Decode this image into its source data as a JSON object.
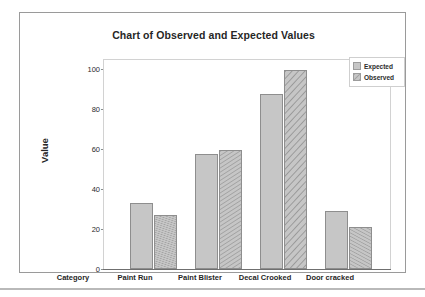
{
  "chart_data": {
    "type": "bar",
    "title": "Chart of Observed and Expected Values",
    "xlabel": "Category",
    "ylabel": "Value",
    "categories": [
      "Paint Run",
      "Paint Blister",
      "Decal Crooked",
      "Door cracked"
    ],
    "series": [
      {
        "name": "Expected",
        "values": [
          33,
          58,
          88,
          29
        ],
        "fill": "solid",
        "color": "#c6c6c6"
      },
      {
        "name": "Observed",
        "values": [
          27,
          60,
          100,
          21
        ],
        "fill": "diagonal-hatch",
        "color": "#c6c6c6"
      }
    ],
    "ylim": [
      0,
      105
    ],
    "yticks": [
      0,
      20,
      40,
      60,
      80,
      100
    ],
    "ytick_labels": [
      "0",
      "20",
      "40",
      "60",
      "80",
      "100"
    ],
    "grid": false,
    "legend_position": "top-right",
    "legend_entries": [
      "Expected",
      "Observed"
    ]
  },
  "colors": {
    "bar_fill": "#c6c6c6",
    "bar_border": "#8e8e8e",
    "plot_border": "#d2d2d2",
    "frame_border": "#9a9a9a",
    "text": "#262626"
  }
}
